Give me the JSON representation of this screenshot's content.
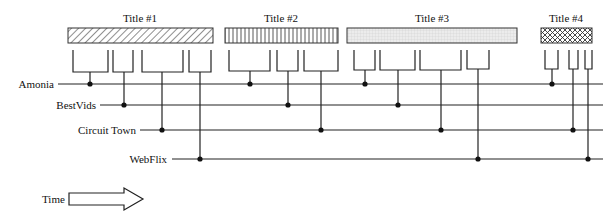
{
  "diagram": {
    "type": "release-window-timeline",
    "titles": [
      {
        "label": "Title #1",
        "pattern": "diagonal-hatch",
        "windows": [
          "Amonia",
          "BestVids",
          "Circuit Town",
          "WebFlix"
        ]
      },
      {
        "label": "Title #2",
        "pattern": "vertical-lines",
        "windows": [
          "Amonia",
          "BestVids",
          "Circuit Town"
        ]
      },
      {
        "label": "Title #3",
        "pattern": "fine-grid",
        "windows": [
          "Amonia",
          "BestVids",
          "Circuit Town",
          "WebFlix"
        ]
      },
      {
        "label": "Title #4",
        "pattern": "crosshatch",
        "windows": [
          "Amonia",
          "Circuit Town",
          "WebFlix"
        ]
      }
    ],
    "channels": [
      {
        "label": "Amonia"
      },
      {
        "label": "BestVids"
      },
      {
        "label": "Circuit Town"
      },
      {
        "label": "WebFlix"
      }
    ],
    "time_label": "Time",
    "time_arrow_icon": "right-arrow-icon",
    "colors": {
      "line": "#222222",
      "dot": "#111111",
      "title3_fill": "#e8e8e8"
    }
  }
}
